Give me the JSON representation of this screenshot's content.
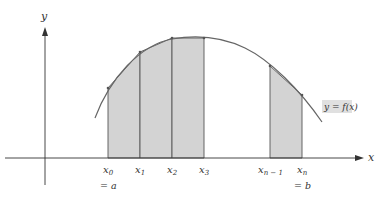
{
  "figure": {
    "type": "trapezoidal-rule-illustration",
    "axes": {
      "x_label": "x",
      "y_label": "y"
    },
    "curve_label": "y = f(x)",
    "points": [
      {
        "name": "x0",
        "base": "x",
        "sub": "0",
        "note": "= a"
      },
      {
        "name": "x1",
        "base": "x",
        "sub": "1",
        "note": ""
      },
      {
        "name": "x2",
        "base": "x",
        "sub": "2",
        "note": ""
      },
      {
        "name": "x3",
        "base": "x",
        "sub": "3",
        "note": ""
      },
      {
        "name": "xn-1",
        "base": "x",
        "sub": "n − 1",
        "note": ""
      },
      {
        "name": "xn",
        "base": "x",
        "sub": "n",
        "note": "= b"
      }
    ],
    "colors": {
      "fill": "#d3d3d3",
      "line": "#555555",
      "axis": "#333333",
      "label_bg": "#e0e0e0"
    }
  }
}
